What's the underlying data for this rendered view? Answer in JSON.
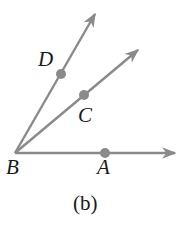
{
  "diagram": {
    "caption": "(b)",
    "colors": {
      "ray": "#8a8a8a",
      "point": "#8a8a8a",
      "text": "#1a1a1a",
      "background": "#ffffff"
    },
    "vertex": {
      "label": "B"
    },
    "rays": [
      {
        "id": "BA",
        "through": "A"
      },
      {
        "id": "BC",
        "through": "C"
      },
      {
        "id": "BD",
        "through": "D"
      }
    ],
    "points": [
      {
        "label": "A"
      },
      {
        "label": "C"
      },
      {
        "label": "D"
      }
    ]
  }
}
